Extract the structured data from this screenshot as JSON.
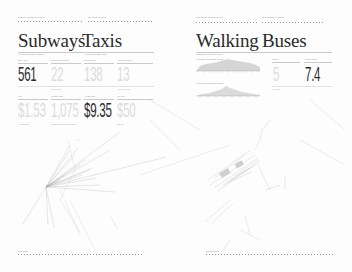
{
  "spread": {
    "left_page": {
      "kickers": [
        "Subway ridership overview",
        "Taxi trips overview"
      ],
      "sections": [
        {
          "title": "Subways",
          "subtitle": "Average weekday ridership",
          "stats": [
            {
              "label": "Daily rides",
              "value": "561",
              "emphasis": true,
              "foot": ""
            },
            {
              "label": "Stations with service",
              "value": "22",
              "emphasis": false,
              "foot": "Lines active"
            },
            {
              "label": "Fare",
              "value": "$1.53",
              "emphasis": false,
              "foot": "Average fare"
            },
            {
              "label": "Monthly pass",
              "value": "1,075",
              "emphasis": false,
              "foot": "Riders using unlimited cards"
            }
          ]
        },
        {
          "title": "Taxis",
          "subtitle": "Average weekday trips",
          "stats": [
            {
              "label": "Trips per hour",
              "value": "138",
              "emphasis": false,
              "foot": ""
            },
            {
              "label": "Average minutes",
              "value": "13",
              "emphasis": false,
              "foot": "Avg trip length"
            },
            {
              "label": "Average fare",
              "value": "$9.35",
              "emphasis": true,
              "foot": ""
            },
            {
              "label": "Max fare",
              "value": "$50",
              "emphasis": false,
              "foot": "Top fare"
            }
          ]
        }
      ],
      "footer_label": "Trip origins"
    },
    "right_page": {
      "kickers": [
        "Pedestrian counts overview",
        "Bus ridership overview"
      ],
      "sections": [
        {
          "title": "Walking",
          "subtitle": "Pedestrian activity by hour",
          "histograms": [
            {
              "label": "Weekday pedestrian counts"
            },
            {
              "label": "Weekend pedestrian counts"
            }
          ]
        },
        {
          "title": "Buses",
          "subtitle": "",
          "stats": [
            {
              "label": "Routes",
              "value": "5",
              "emphasis": false,
              "foot": "Avg wait"
            },
            {
              "label": "Average speed",
              "value": "7.4",
              "emphasis": true,
              "foot": ""
            }
          ]
        }
      ],
      "footer_label": "Street network"
    }
  },
  "colors": {
    "ink": "#2b2b2b",
    "faint": "#dcdcdc",
    "rule": "#c9c9c9",
    "background": "#fdfdfd"
  }
}
